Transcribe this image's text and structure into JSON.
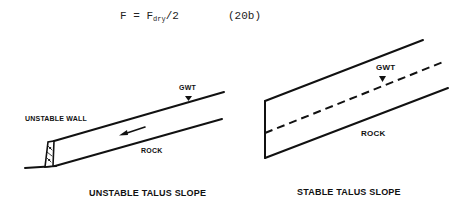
{
  "equation": {
    "lhs": "F",
    "op": "=",
    "rhs_main": "F",
    "rhs_sub": "dry",
    "rhs_tail": "/2",
    "number": "(20b)"
  },
  "figures": {
    "left": {
      "caption": "UNSTABLE TALUS SLOPE",
      "labels": {
        "wall": "UNSTABLE WALL",
        "gwt": "GWT",
        "rock": "ROCK"
      },
      "arrow": "movement-arrow-downslope"
    },
    "right": {
      "caption": "STABLE TALUS SLOPE",
      "labels": {
        "gwt": "GWT",
        "rock": "ROCK"
      }
    }
  },
  "colors": {
    "ink": "#111111",
    "background": "#ffffff"
  }
}
